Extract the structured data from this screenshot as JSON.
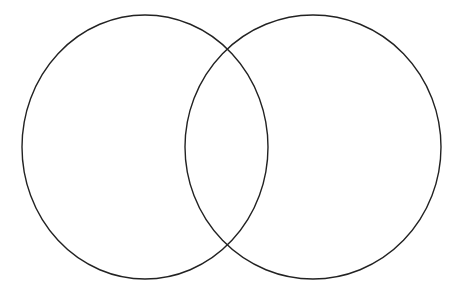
{
  "diagram": {
    "type": "venn",
    "background": "#ffffff",
    "stroke_color": "#222222",
    "stroke_width": 1.4,
    "sets": [
      {
        "name": "left-set",
        "cx": 145,
        "cy": 147,
        "rx": 123,
        "ry": 132
      },
      {
        "name": "right-set",
        "cx": 313,
        "cy": 147,
        "rx": 128,
        "ry": 132
      }
    ]
  }
}
